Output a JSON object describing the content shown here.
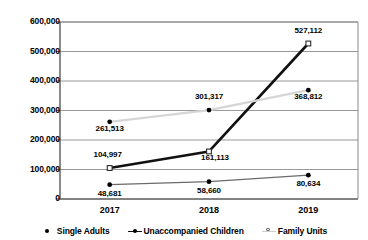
{
  "chart_data": {
    "type": "line",
    "title": "",
    "subtitle": "",
    "xlabel": "",
    "ylabel": "",
    "categories": [
      "2017",
      "2018",
      "2019"
    ],
    "ylim": [
      0,
      600000
    ],
    "ytick_values": [
      0,
      100000,
      200000,
      300000,
      400000,
      500000,
      600000
    ],
    "ytick_labels": [
      "0",
      "100,000",
      "200,000",
      "300,000",
      "400,000",
      "500,000",
      "600,000"
    ],
    "grid": true,
    "legend_position": "bottom",
    "series": [
      {
        "name": "Single Adults",
        "marker": "filled-dot",
        "color": "#000000",
        "line_color": "#6b6b6b",
        "values": [
          48681,
          58660,
          80634
        ],
        "labels": [
          "48,681",
          "58,660",
          "80,634"
        ]
      },
      {
        "name": "Unaccompanied Children",
        "marker": "open-square",
        "color": "#000000",
        "line_color": "#111111",
        "values": [
          104997,
          161113,
          527112
        ],
        "labels": [
          "104,997",
          "161,113",
          "527,112"
        ]
      },
      {
        "name": "Family Units",
        "marker": "filled-dot",
        "color": "#000000",
        "line_color": "#d6d6d6",
        "values": [
          261513,
          301317,
          368812
        ],
        "labels": [
          "261,513",
          "301,317",
          "368,812"
        ]
      }
    ]
  },
  "legend": {
    "items": [
      {
        "label": "Single Adults",
        "style": "dot-only"
      },
      {
        "label": "Unaccompanied Children",
        "style": "line-dot-dark"
      },
      {
        "label": "Family Units",
        "style": "line-open-light"
      }
    ]
  },
  "colors": {
    "axis": "#595959",
    "grid": "#7f7f7f",
    "single_adults_line": "#6b6b6b",
    "unaccompanied_children_line": "#111111",
    "family_units_line": "#d6d6d6",
    "text": "#000000",
    "background": "#ffffff"
  }
}
